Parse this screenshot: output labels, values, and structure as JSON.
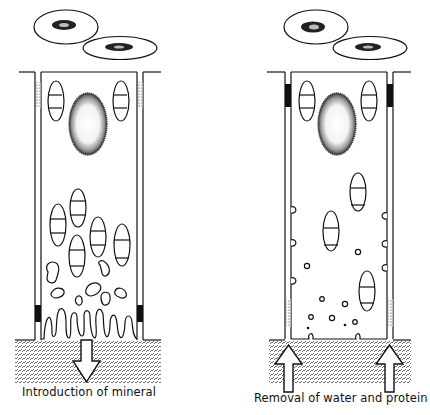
{
  "diagram": {
    "panels": [
      {
        "id": "left",
        "caption": "Introduction of mineral",
        "junction_style": "stippled-top, solid-bottom",
        "arrow_direction": "down"
      },
      {
        "id": "right",
        "caption": "Removal of water and protein",
        "junction_style": "solid-top, stippled-bottom",
        "arrow_direction": "up"
      }
    ],
    "colors": {
      "ink": "#111111",
      "background": "#ffffff"
    }
  }
}
